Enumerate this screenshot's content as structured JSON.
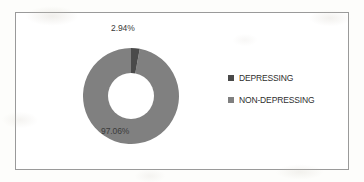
{
  "chart_data": {
    "type": "pie",
    "variant": "doughnut",
    "title": "",
    "xlabel": "",
    "ylabel": "",
    "categories": [
      "DEPRESSING",
      "NON-DEPRESSING"
    ],
    "values": [
      2.94,
      97.06
    ],
    "unit": "%",
    "data_labels": [
      "2.94%",
      "97.06%"
    ],
    "colors": [
      "#4a4a4a",
      "#808080"
    ],
    "legend_position": "right",
    "grid": false,
    "slices": [
      {
        "label": "DEPRESSING",
        "value": 2.94,
        "data_label": "2.94%",
        "color": "#4a4a4a"
      },
      {
        "label": "NON-DEPRESSING",
        "value": 97.06,
        "data_label": "97.06%",
        "color": "#808080"
      }
    ]
  },
  "labels": {
    "small_slice": "2.94%",
    "large_slice": "97.06%"
  },
  "legend": {
    "items": [
      {
        "label": "DEPRESSING",
        "color": "#4a4a4a"
      },
      {
        "label": "NON-DEPRESSING",
        "color": "#808080"
      }
    ]
  },
  "colors": {
    "depressing": "#4a4a4a",
    "non_depressing": "#808080",
    "frame_border": "#9a9a9a",
    "label_text": "#3a3a3a",
    "background": "#fdfdfb"
  }
}
